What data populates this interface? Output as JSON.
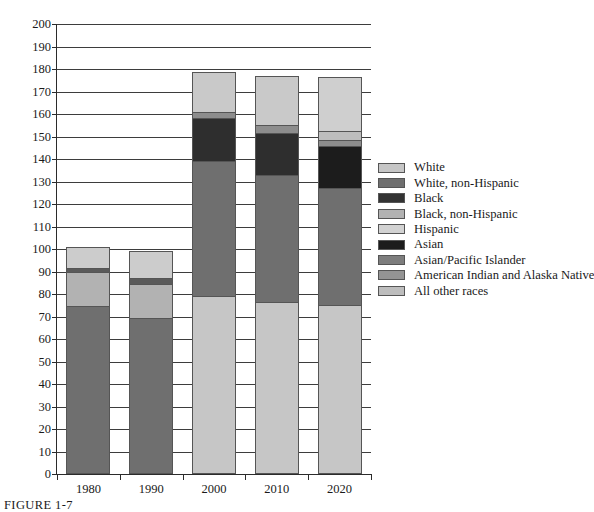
{
  "caption": "FIGURE 1-7",
  "chart_data": {
    "type": "bar",
    "subtype": "stacked",
    "title": "",
    "xlabel": "",
    "ylabel": "",
    "ylim": [
      0,
      200
    ],
    "ytick_step": 10,
    "grid": true,
    "legend_position": "right",
    "categories": [
      "1980",
      "1990",
      "2000",
      "2010",
      "2020"
    ],
    "ytick_labels": [
      "0",
      "10",
      "20",
      "30",
      "40",
      "50",
      "60",
      "70",
      "80",
      "90",
      "100",
      "110",
      "120",
      "130",
      "140",
      "150",
      "160",
      "170",
      "180",
      "190",
      "200"
    ],
    "legend": [
      {
        "label": "White",
        "color": "#c6c6c6"
      },
      {
        "label": "White, non-Hispanic",
        "color": "#6f6f6f"
      },
      {
        "label": "Black",
        "color": "#333333"
      },
      {
        "label": "Black, non-Hispanic",
        "color": "#b2b2b2"
      },
      {
        "label": "Hispanic",
        "color": "#d2d2d2"
      },
      {
        "label": "Asian",
        "color": "#1c1c1c"
      },
      {
        "label": "Asian/Pacific Islander",
        "color": "#7d7d7d"
      },
      {
        "label": "American Indian and Alaska Native",
        "color": "#949494"
      },
      {
        "label": "All other races",
        "color": "#bdbdbd"
      }
    ],
    "series": [
      {
        "name": "White",
        "values": [
          0,
          0,
          78.5,
          76,
          74.5
        ]
      },
      {
        "name": "White, non-Hispanic",
        "values": [
          74.5,
          69,
          0,
          0,
          0
        ]
      },
      {
        "name": "Black",
        "values": [
          15,
          15.5,
          0,
          0,
          0
        ]
      },
      {
        "name": "Black, non-Hispanic",
        "values": [
          0,
          0,
          60.5,
          56.5,
          52.5
        ]
      },
      {
        "name": "Hispanic",
        "values": [
          9.5,
          12,
          19,
          21,
          24
        ]
      },
      {
        "name": "Asian",
        "values": [
          0,
          0,
          0,
          0,
          18.5
        ]
      },
      {
        "name": "Asian/Pacific Islander",
        "values": [
          2,
          2.5,
          17.5,
          19,
          0
        ]
      },
      {
        "name": "American Indian and Alaska Native",
        "values": [
          0,
          0,
          3,
          3.5,
          3
        ]
      },
      {
        "name": "All other races",
        "values": [
          0,
          0,
          0,
          0,
          4
        ]
      }
    ],
    "bars": [
      {
        "category": "1980",
        "total": 101,
        "segments": [
          {
            "name": "White, non-Hispanic",
            "value": 74.5,
            "color": "#6f6f6f"
          },
          {
            "name": "Black",
            "value": 15.0,
            "color": "#b2b2b2"
          },
          {
            "name": "Asian/Pacific Islander",
            "value": 2.0,
            "color": "#5a5a5a"
          },
          {
            "name": "Hispanic",
            "value": 9.5,
            "color": "#cccccc"
          }
        ]
      },
      {
        "category": "1990",
        "total": 99,
        "segments": [
          {
            "name": "White, non-Hispanic",
            "value": 69.0,
            "color": "#6f6f6f"
          },
          {
            "name": "Black",
            "value": 15.5,
            "color": "#b2b2b2"
          },
          {
            "name": "Asian/Pacific Islander",
            "value": 2.5,
            "color": "#5a5a5a"
          },
          {
            "name": "Hispanic",
            "value": 12.0,
            "color": "#cccccc"
          }
        ]
      },
      {
        "category": "2000",
        "total": 178.5,
        "segments": [
          {
            "name": "White",
            "value": 78.5,
            "color": "#c6c6c6"
          },
          {
            "name": "Black, non-Hispanic",
            "value": 60.5,
            "color": "#6f6f6f"
          },
          {
            "name": "Black",
            "value": 19.0,
            "color": "#2e2e2e"
          },
          {
            "name": "American Indian and Alaska Native",
            "value": 3.0,
            "color": "#8d8d8d"
          },
          {
            "name": "Hispanic",
            "value": 17.5,
            "color": "#c9c9c9"
          }
        ]
      },
      {
        "category": "2010",
        "total": 177,
        "segments": [
          {
            "name": "White",
            "value": 76.0,
            "color": "#c6c6c6"
          },
          {
            "name": "Black, non-Hispanic",
            "value": 56.5,
            "color": "#6f6f6f"
          },
          {
            "name": "Black",
            "value": 19.0,
            "color": "#2e2e2e"
          },
          {
            "name": "American Indian and Alaska Native",
            "value": 3.5,
            "color": "#8d8d8d"
          },
          {
            "name": "Hispanic",
            "value": 22.0,
            "color": "#c9c9c9"
          }
        ]
      },
      {
        "category": "2020",
        "total": 176.5,
        "segments": [
          {
            "name": "White",
            "value": 74.5,
            "color": "#c6c6c6"
          },
          {
            "name": "Black, non-Hispanic",
            "value": 52.5,
            "color": "#6f6f6f"
          },
          {
            "name": "Asian",
            "value": 18.5,
            "color": "#1c1c1c"
          },
          {
            "name": "American Indian and Alaska Native",
            "value": 3.0,
            "color": "#8d8d8d"
          },
          {
            "name": "All other races",
            "value": 4.0,
            "color": "#bdbdbd"
          },
          {
            "name": "Hispanic",
            "value": 24.0,
            "color": "#cfcfcf"
          }
        ]
      }
    ]
  }
}
